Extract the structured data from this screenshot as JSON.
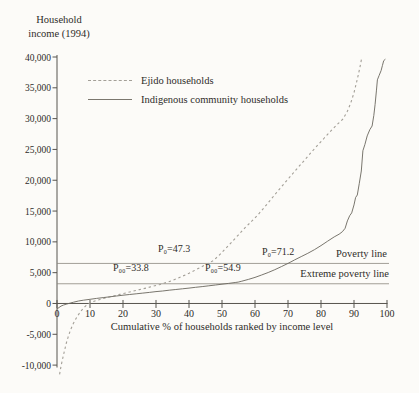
{
  "chart_data": {
    "type": "line",
    "title": "Household income (1994)",
    "xlabel": "Cumulative % of households ranked by income level",
    "ylabel": "Household income (1994)",
    "xlim": [
      0,
      100
    ],
    "ylim": [
      -10000,
      40000
    ],
    "grid": false,
    "legend_position": "upper-left-inside",
    "x_ticks": [
      0,
      10,
      20,
      30,
      40,
      50,
      60,
      70,
      80,
      90,
      100
    ],
    "y_ticks": [
      {
        "value": 40000,
        "label": "40,000"
      },
      {
        "value": 35000,
        "label": "35,000"
      },
      {
        "value": 30000,
        "label": "30,000"
      },
      {
        "value": 25000,
        "label": "25,000"
      },
      {
        "value": 20000,
        "label": "20,000"
      },
      {
        "value": 15000,
        "label": "15,000"
      },
      {
        "value": 10000,
        "label": "10,000"
      },
      {
        "value": 5000,
        "label": "5,000"
      },
      {
        "value": 0,
        "label": "0"
      },
      {
        "value": -5000,
        "label": "-5,000"
      },
      {
        "value": -10000,
        "label": "-10,000"
      }
    ],
    "reference_lines": [
      {
        "id": "poverty-line",
        "label": "Poverty line",
        "value": 6500
      },
      {
        "id": "extreme-poverty-line",
        "label": "Extreme poverty line",
        "value": 3200
      }
    ],
    "annotations": [
      {
        "id": "p0-ejido",
        "text": "P₀=47.3"
      },
      {
        "id": "p0-indigenous",
        "text": "P₀=71.2"
      },
      {
        "id": "p00-ejido",
        "text": "P₀₀=33.8"
      },
      {
        "id": "p00-indigenous",
        "text": "P₀₀=54.9"
      }
    ],
    "series": [
      {
        "name": "Ejido households",
        "style": "dashed",
        "color": "#a39f97",
        "points": [
          [
            0.8,
            -11500
          ],
          [
            1.2,
            -10200
          ],
          [
            1.7,
            -9000
          ],
          [
            2.2,
            -7800
          ],
          [
            2.8,
            -6500
          ],
          [
            3.4,
            -5400
          ],
          [
            4.1,
            -4300
          ],
          [
            4.9,
            -3300
          ],
          [
            5.7,
            -2500
          ],
          [
            6.5,
            -1800
          ],
          [
            7.3,
            -1200
          ],
          [
            8.1,
            -700
          ],
          [
            9,
            -250
          ],
          [
            10,
            100
          ],
          [
            11.5,
            420
          ],
          [
            13,
            650
          ],
          [
            15,
            950
          ],
          [
            17,
            1200
          ],
          [
            19,
            1480
          ],
          [
            21,
            1720
          ],
          [
            23,
            2000
          ],
          [
            25,
            2250
          ],
          [
            27,
            2500
          ],
          [
            29,
            2780
          ],
          [
            31,
            3050
          ],
          [
            33.8,
            3500
          ],
          [
            36,
            3980
          ],
          [
            38,
            4420
          ],
          [
            40,
            4900
          ],
          [
            42,
            5450
          ],
          [
            44,
            6000
          ],
          [
            46,
            6550
          ],
          [
            47.3,
            6950
          ],
          [
            49,
            7750
          ],
          [
            51,
            8850
          ],
          [
            53,
            10000
          ],
          [
            55,
            11150
          ],
          [
            57,
            12300
          ],
          [
            59,
            13350
          ],
          [
            61,
            14450
          ],
          [
            63,
            15700
          ],
          [
            65,
            17000
          ],
          [
            67,
            18300
          ],
          [
            69,
            19550
          ],
          [
            71,
            20800
          ],
          [
            73,
            22050
          ],
          [
            75,
            23250
          ],
          [
            77,
            24500
          ],
          [
            79,
            25700
          ],
          [
            81,
            26850
          ],
          [
            83,
            28000
          ],
          [
            85,
            29100
          ],
          [
            86.7,
            29950
          ],
          [
            88,
            31200
          ],
          [
            89,
            32500
          ],
          [
            90,
            34200
          ],
          [
            91,
            36400
          ],
          [
            91.8,
            38300
          ],
          [
            92.4,
            40000
          ]
        ]
      },
      {
        "name": "Indigenous community households",
        "style": "solid",
        "color": "#6a665e",
        "points": [
          [
            0,
            -900
          ],
          [
            0.6,
            -650
          ],
          [
            1.2,
            -430
          ],
          [
            2,
            -250
          ],
          [
            3,
            -90
          ],
          [
            4,
            60
          ],
          [
            5,
            210
          ],
          [
            6.5,
            400
          ],
          [
            8,
            530
          ],
          [
            10,
            680
          ],
          [
            12,
            820
          ],
          [
            14,
            960
          ],
          [
            16,
            1090
          ],
          [
            18,
            1220
          ],
          [
            20,
            1340
          ],
          [
            22,
            1460
          ],
          [
            24,
            1570
          ],
          [
            26,
            1690
          ],
          [
            28,
            1800
          ],
          [
            30,
            1920
          ],
          [
            32,
            2030
          ],
          [
            34,
            2150
          ],
          [
            36,
            2270
          ],
          [
            38,
            2380
          ],
          [
            40,
            2500
          ],
          [
            42,
            2620
          ],
          [
            44,
            2740
          ],
          [
            46,
            2870
          ],
          [
            48,
            3000
          ],
          [
            50,
            3130
          ],
          [
            52,
            3260
          ],
          [
            54,
            3400
          ],
          [
            54.9,
            3470
          ],
          [
            56,
            3620
          ],
          [
            58,
            3900
          ],
          [
            60,
            4230
          ],
          [
            62,
            4620
          ],
          [
            64,
            5030
          ],
          [
            66,
            5480
          ],
          [
            68,
            5980
          ],
          [
            70,
            6500
          ],
          [
            71.2,
            6850
          ],
          [
            72,
            7080
          ],
          [
            74,
            7600
          ],
          [
            76,
            8150
          ],
          [
            78,
            8720
          ],
          [
            80,
            9400
          ],
          [
            82,
            10100
          ],
          [
            84,
            10800
          ],
          [
            85.5,
            11250
          ],
          [
            86.5,
            11650
          ],
          [
            87.3,
            12200
          ],
          [
            88,
            13400
          ],
          [
            88.7,
            14250
          ],
          [
            89.3,
            14700
          ],
          [
            90,
            16000
          ],
          [
            90.5,
            17200
          ],
          [
            91,
            17600
          ],
          [
            91.6,
            19500
          ],
          [
            92.2,
            21500
          ],
          [
            92.7,
            24800
          ],
          [
            93.3,
            25800
          ],
          [
            94,
            27200
          ],
          [
            94.8,
            28200
          ],
          [
            95.5,
            28800
          ],
          [
            96,
            30500
          ],
          [
            96.4,
            32300
          ],
          [
            96.8,
            34500
          ],
          [
            97.1,
            36300
          ],
          [
            97.6,
            37000
          ],
          [
            98.2,
            37800
          ],
          [
            98.6,
            38600
          ],
          [
            99,
            39400
          ],
          [
            99.5,
            39650
          ]
        ]
      }
    ],
    "colors": {
      "background": "#fcfbf8",
      "axis": "#57544e",
      "text": "#2e2c28",
      "reference": "#8b887f",
      "ejido": "#a39f97",
      "indigenous": "#6a665e"
    }
  }
}
